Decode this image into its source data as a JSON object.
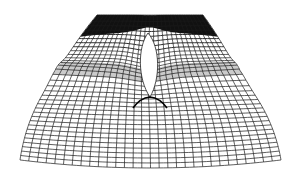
{
  "figure": {
    "description": "3D wireframe mesh surface with a lens-shaped slit in the center",
    "background_color": "#ffffff",
    "line_color": "#1a1a1a",
    "dark_region_color": "#111111",
    "grid": {
      "rows": 34,
      "cols": 30
    },
    "silhouette": {
      "top_left": [
        97,
        15
      ],
      "top_right": [
        203,
        15
      ],
      "mid_left": [
        55,
        90
      ],
      "mid_right": [
        240,
        90
      ],
      "bottom_left": [
        20,
        168
      ],
      "bottom_right": [
        281,
        168
      ],
      "bottom_dip": [
        146,
        176
      ]
    },
    "slit": {
      "top": [
        148,
        33
      ],
      "bottom": [
        150,
        97
      ],
      "half_width": 8.5
    },
    "ridge": {
      "left": [
        133,
        108
      ],
      "apex": [
        150,
        97
      ],
      "right": [
        167,
        108
      ]
    }
  }
}
